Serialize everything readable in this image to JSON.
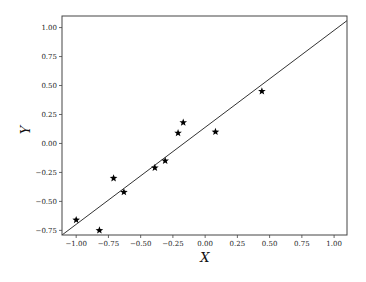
{
  "chart_data": {
    "type": "scatter",
    "title": "",
    "xlabel": "X",
    "ylabel": "Y",
    "xlim": [
      -1.11,
      1.1
    ],
    "ylim": [
      -0.79,
      1.1
    ],
    "grid": false,
    "legend": null,
    "x_ticks": [
      -1.0,
      -0.75,
      -0.5,
      -0.25,
      0.0,
      0.25,
      0.5,
      0.75,
      1.0
    ],
    "x_tick_labels": [
      "−1.00",
      "−0.75",
      "−0.50",
      "−0.25",
      "0.00",
      "0.25",
      "0.50",
      "0.75",
      "1.00"
    ],
    "y_ticks": [
      -0.75,
      -0.5,
      -0.25,
      0.0,
      0.25,
      0.5,
      0.75,
      1.0
    ],
    "y_tick_labels": [
      "−0.75",
      "−0.50",
      "−0.25",
      "0.00",
      "0.25",
      "0.50",
      "0.75",
      "1.00"
    ],
    "series": [
      {
        "name": "points",
        "marker": "star",
        "color": "#000000",
        "x": [
          -1.0,
          -0.82,
          -0.71,
          -0.63,
          -0.39,
          -0.31,
          -0.21,
          -0.17,
          0.08,
          0.44
        ],
        "y": [
          -0.66,
          -0.75,
          -0.3,
          -0.42,
          -0.21,
          -0.15,
          0.09,
          0.18,
          0.1,
          0.45
        ]
      },
      {
        "name": "fit-line",
        "type": "line",
        "color": "#333333",
        "x": [
          -1.11,
          1.1
        ],
        "y": [
          -0.79,
          1.06
        ]
      }
    ]
  }
}
